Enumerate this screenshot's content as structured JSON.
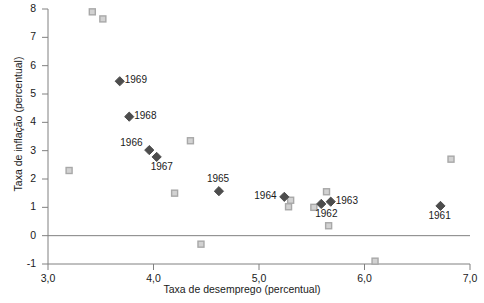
{
  "chart_data": {
    "type": "scatter",
    "title": "",
    "xlabel": "Taxa de desemprego (percentual)",
    "ylabel": "Taxa de inflação (percentual)",
    "xlim": [
      3.0,
      7.0
    ],
    "ylim": [
      -1,
      8
    ],
    "xticks": [
      "3,0",
      "4,0",
      "5,0",
      "6,0",
      "7,0"
    ],
    "xtick_values": [
      3.0,
      4.0,
      5.0,
      6.0,
      7.0
    ],
    "yticks": [
      "8",
      "7",
      "6",
      "5",
      "4",
      "3",
      "2",
      "1",
      "0",
      "-1"
    ],
    "ytick_values": [
      8,
      7,
      6,
      5,
      4,
      3,
      2,
      1,
      0,
      -1
    ],
    "grid": false,
    "zero_line": true,
    "legend": "none",
    "series": [
      {
        "name": "labeled-years",
        "marker": "diamond",
        "color": "#4d4d4d",
        "points": [
          {
            "label": "1969",
            "x": 3.68,
            "y": 5.45,
            "label_pos": "right"
          },
          {
            "label": "1968",
            "x": 3.77,
            "y": 4.2,
            "label_pos": "right"
          },
          {
            "label": "1966",
            "x": 3.96,
            "y": 3.02,
            "label_pos": "left-above"
          },
          {
            "label": "1967",
            "x": 4.03,
            "y": 2.78,
            "label_pos": "below-right"
          },
          {
            "label": "1965",
            "x": 4.62,
            "y": 1.57,
            "label_pos": "above"
          },
          {
            "label": "1964",
            "x": 5.24,
            "y": 1.37,
            "label_pos": "left"
          },
          {
            "label": "1963",
            "x": 5.68,
            "y": 1.2,
            "label_pos": "right"
          },
          {
            "label": "1962",
            "x": 5.59,
            "y": 1.12,
            "label_pos": "below-right"
          },
          {
            "label": "1961",
            "x": 6.72,
            "y": 1.05,
            "label_pos": "below"
          }
        ]
      },
      {
        "name": "unlabeled-observations",
        "marker": "square",
        "color": "#a8a8a8",
        "points": [
          {
            "x": 3.42,
            "y": 7.9
          },
          {
            "x": 3.52,
            "y": 7.65
          },
          {
            "x": 3.2,
            "y": 2.3
          },
          {
            "x": 4.35,
            "y": 3.35
          },
          {
            "x": 4.2,
            "y": 1.5
          },
          {
            "x": 4.45,
            "y": -0.3
          },
          {
            "x": 5.3,
            "y": 1.25
          },
          {
            "x": 5.28,
            "y": 1.02
          },
          {
            "x": 5.52,
            "y": 1.0
          },
          {
            "x": 5.64,
            "y": 1.55
          },
          {
            "x": 5.66,
            "y": 0.35
          },
          {
            "x": 6.82,
            "y": 2.7
          },
          {
            "x": 6.1,
            "y": -0.9
          }
        ]
      }
    ]
  },
  "axis": {
    "y_title": "Taxa de inflação (percentual)",
    "x_title": "Taxa de desemprego (percentual)"
  },
  "colors": {
    "diamond": "#4d4d4d",
    "square": "#a8a8a8",
    "axis": "#808080",
    "text": "#1a1a1a"
  }
}
